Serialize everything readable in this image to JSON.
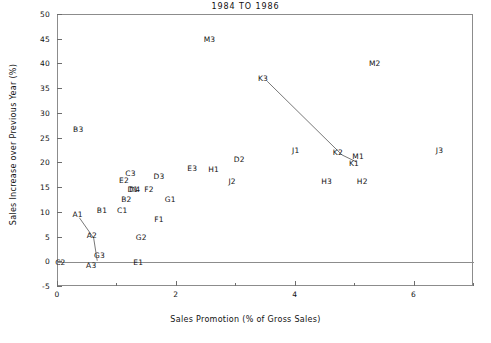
{
  "chart_data": {
    "type": "scatter",
    "title": "1984 TO 1986",
    "xlabel": "Sales Promotion (% of Gross Sales)",
    "ylabel": "Sales Increase over Previous Year (%)",
    "xlim": [
      0,
      7
    ],
    "ylim": [
      -5,
      50
    ],
    "grid": false,
    "legend": "none",
    "marker_style": "text-label-only",
    "xticks_major": [
      0,
      2,
      4,
      6
    ],
    "xticks_minor": [
      1,
      3,
      5,
      7
    ],
    "xtick_labels": [
      "0",
      "2",
      "4",
      "6"
    ],
    "yticks_major": [
      -5,
      0,
      5,
      10,
      15,
      20,
      25,
      30,
      35,
      40,
      45,
      50
    ],
    "ytick_labels": [
      "-5",
      "0",
      "5",
      "10",
      "15",
      "20",
      "25",
      "30",
      "35",
      "40",
      "45",
      "50"
    ],
    "reference_lines": [
      {
        "name": "zero-line",
        "axis": "y",
        "value": 0
      }
    ],
    "points": [
      {
        "label": "A1",
        "x": 0.33,
        "y": 9.5
      },
      {
        "label": "A2",
        "x": 0.57,
        "y": 5.3
      },
      {
        "label": "A3",
        "x": 0.56,
        "y": -0.8
      },
      {
        "label": "B1",
        "x": 0.74,
        "y": 10.4
      },
      {
        "label": "B2",
        "x": 1.15,
        "y": 12.5
      },
      {
        "label": "B3",
        "x": 0.34,
        "y": 26.8
      },
      {
        "label": "C1",
        "x": 1.08,
        "y": 10.4
      },
      {
        "label": "C2",
        "x": 0.04,
        "y": -0.1
      },
      {
        "label": "C3",
        "x": 1.22,
        "y": 17.8
      },
      {
        "label": "D1",
        "x": 1.26,
        "y": 14.6
      },
      {
        "label": "D2",
        "x": 3.05,
        "y": 20.6
      },
      {
        "label": "D3",
        "x": 1.7,
        "y": 17.2
      },
      {
        "label": "D4",
        "x": 1.29,
        "y": 14.6
      },
      {
        "label": "E1",
        "x": 1.35,
        "y": -0.1
      },
      {
        "label": "E2",
        "x": 1.11,
        "y": 16.4
      },
      {
        "label": "E3",
        "x": 2.26,
        "y": 18.8
      },
      {
        "label": "F1",
        "x": 1.7,
        "y": 8.6
      },
      {
        "label": "F2",
        "x": 1.53,
        "y": 14.6
      },
      {
        "label": "G1",
        "x": 1.89,
        "y": 12.5
      },
      {
        "label": "G2",
        "x": 1.4,
        "y": 5.0
      },
      {
        "label": "G3",
        "x": 0.7,
        "y": 1.2
      },
      {
        "label": "H1",
        "x": 2.62,
        "y": 18.6
      },
      {
        "label": "H2",
        "x": 5.12,
        "y": 16.3
      },
      {
        "label": "H3",
        "x": 4.52,
        "y": 16.2
      },
      {
        "label": "J1",
        "x": 4.0,
        "y": 22.6
      },
      {
        "label": "J2",
        "x": 2.93,
        "y": 16.3
      },
      {
        "label": "J3",
        "x": 6.42,
        "y": 22.4
      },
      {
        "label": "K1",
        "x": 4.98,
        "y": 19.9
      },
      {
        "label": "K2",
        "x": 4.71,
        "y": 22.0
      },
      {
        "label": "K3",
        "x": 3.45,
        "y": 37.0
      },
      {
        "label": "M1",
        "x": 5.05,
        "y": 21.2
      },
      {
        "label": "M2",
        "x": 5.33,
        "y": 40.0
      },
      {
        "label": "M3",
        "x": 2.55,
        "y": 45.0
      }
    ],
    "connected_series": [
      {
        "name": "A-series",
        "path_labels": [
          "A1",
          "A2",
          "A3"
        ],
        "points": [
          {
            "x": 0.36,
            "y": 9.0
          },
          {
            "x": 0.6,
            "y": 4.9
          },
          {
            "x": 0.66,
            "y": 0.3
          }
        ]
      },
      {
        "name": "K-series",
        "path_labels": [
          "K3",
          "K2",
          "K1"
        ],
        "points": [
          {
            "x": 3.52,
            "y": 36.6
          },
          {
            "x": 4.78,
            "y": 21.7
          },
          {
            "x": 5.02,
            "y": 20.3
          }
        ]
      }
    ]
  },
  "colors": {
    "background": "#ffffff",
    "axis": "#8c8c8c",
    "tick": "#6d6d6d",
    "text": "#111111",
    "series_line": "#555555"
  }
}
